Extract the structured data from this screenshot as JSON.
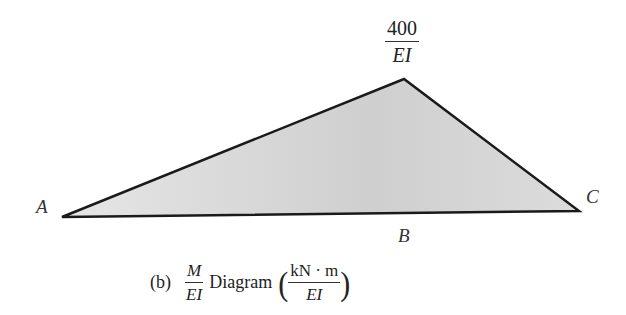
{
  "diagram": {
    "points": {
      "A": {
        "label": "A",
        "x": 62,
        "y": 217
      },
      "peak": {
        "x": 404,
        "y": 79
      },
      "C": {
        "label": "C",
        "x": 579,
        "y": 211
      },
      "B": {
        "label": "B"
      }
    },
    "fill_color": "#d0d0d0",
    "stroke_color": "#1a1a1a",
    "peak_value": {
      "numerator": "400",
      "denominator": "EI"
    },
    "caption": {
      "prefix": "(b)",
      "ratio_numerator": "M",
      "ratio_denominator": "EI",
      "text": "Diagram",
      "open_paren": "(",
      "unit_numerator": "kN · m",
      "unit_denominator": "EI",
      "close_paren": ")"
    }
  }
}
